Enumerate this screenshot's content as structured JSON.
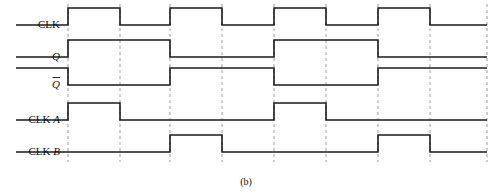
{
  "figure": {
    "caption": "(b)",
    "caption_x": 246,
    "caption_y": 185,
    "width": 499,
    "height": 195,
    "background_color": "#ffffff",
    "wave_color": "#1a1a1a",
    "grid_color": "#9b9b9b"
  },
  "axis": {
    "t_start": 16,
    "t_end": 487,
    "label_right_x": 60,
    "transition_x": [
      68,
      120,
      170,
      222,
      274,
      326,
      378,
      430
    ],
    "grid_top": 4,
    "grid_bottom": 162
  },
  "signals": [
    {
      "name": "CLK",
      "label": "CLK",
      "italic_suffix": "",
      "label_x": 60,
      "label_y": 25,
      "y_high": 8,
      "y_low": 25,
      "initial_level": 0,
      "edges": [
        68,
        120,
        170,
        222,
        274,
        326,
        378,
        430
      ],
      "path": "M16,25 L68,25 L68,8 L120,8 L120,25 L170,25 L170,8 L222,8 L222,25 L274,25 L274,8 L326,8 L326,25 L378,25 L378,8 L430,8 L430,25 L487,25"
    },
    {
      "name": "Q",
      "label": "Q",
      "italic_suffix": "",
      "label_x": 60,
      "label_y": 57,
      "y_high": 40,
      "y_low": 57,
      "initial_level": 0,
      "edges": [
        68,
        170,
        274,
        378
      ],
      "path": "M16,57 L68,57 L68,40 L170,40 L170,57 L274,57 L274,40 L378,40 L378,57 L487,57"
    },
    {
      "name": "Q-bar",
      "label": "Q",
      "italic_suffix": "overbar",
      "label_x": 60,
      "label_y": 85,
      "y_high": 68,
      "y_low": 85,
      "initial_level": 1,
      "edges": [
        68,
        170,
        274,
        378
      ],
      "path": "M16,68 L68,68 L68,85 L170,85 L170,68 L274,68 L274,85 L378,85 L378,68 L487,68"
    },
    {
      "name": "CLK-A",
      "label": "CLK A",
      "italic_suffix": "A",
      "label_x": 60,
      "label_y": 120,
      "y_high": 103,
      "y_low": 120,
      "initial_level": 0,
      "edges": [
        68,
        120,
        274,
        326
      ],
      "path": "M16,120 L68,120 L68,103 L120,103 L120,120 L274,120 L274,103 L326,103 L326,120 L487,120"
    },
    {
      "name": "CLK-B",
      "label": "CLK B",
      "italic_suffix": "B",
      "label_x": 60,
      "label_y": 152,
      "y_high": 135,
      "y_low": 152,
      "initial_level": 0,
      "edges": [
        170,
        222,
        378,
        430
      ],
      "path": "M16,152 L170,152 L170,135 L222,135 L222,152 L378,152 L378,135 L430,135 L430,152 L487,152"
    }
  ],
  "chart_data": {
    "type": "line",
    "title": "(b)",
    "xlabel": "time",
    "ylabel": "logic level",
    "x": [
      68,
      120,
      170,
      222,
      274,
      326,
      378,
      430
    ],
    "series": [
      {
        "name": "CLK",
        "values": [
          1,
          0,
          1,
          0,
          1,
          0,
          1,
          0
        ]
      },
      {
        "name": "Q",
        "values": [
          1,
          1,
          0,
          0,
          1,
          1,
          0,
          0
        ]
      },
      {
        "name": "Q̅",
        "values": [
          0,
          0,
          1,
          1,
          0,
          0,
          1,
          1
        ]
      },
      {
        "name": "CLK A",
        "values": [
          1,
          0,
          0,
          0,
          1,
          0,
          0,
          0
        ]
      },
      {
        "name": "CLK B",
        "values": [
          0,
          0,
          1,
          0,
          0,
          0,
          1,
          0
        ]
      }
    ],
    "grid": true,
    "legend": "left-axis-labels"
  }
}
